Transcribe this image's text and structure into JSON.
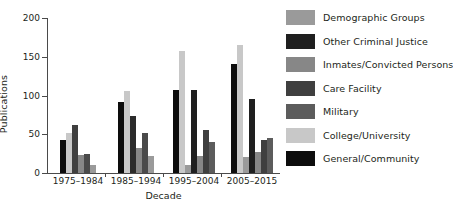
{
  "chart_data": {
    "type": "bar",
    "title": "",
    "xlabel": "Decade",
    "ylabel": "Publications",
    "categories": [
      "1975–1984",
      "1985–1994",
      "1995–2004",
      "2005–2015"
    ],
    "ylim": [
      0,
      200
    ],
    "yticks": [
      0,
      50,
      100,
      150,
      200
    ],
    "ytick_labels": [
      "0",
      "50",
      "100",
      "150",
      "200"
    ],
    "grid": false,
    "legend_position": "right",
    "bar_order_note": "Within each decade group bars are drawn left to right in the order listed in series[]",
    "series": [
      {
        "name": "General/Community",
        "color": "#0d0d0d",
        "values": [
          42,
          91,
          107,
          141
        ]
      },
      {
        "name": "College/University",
        "color": "#c8c8c8",
        "values": [
          51,
          106,
          157,
          165
        ]
      },
      {
        "name": "Military",
        "color": "#5c5c5c",
        "values": [
          0,
          0,
          0,
          0
        ]
      },
      {
        "name": "Care Facility",
        "color": "#3f3f3f",
        "values": [
          62,
          73,
          0,
          0
        ]
      },
      {
        "name": "Inmates/Convicted Persons",
        "color": "#878787",
        "values": [
          23,
          32,
          10,
          21
        ]
      },
      {
        "name": "Other Criminal Justice",
        "color": "#1f1f1f",
        "values": [
          25,
          52,
          107,
          95
        ]
      },
      {
        "name": "Demographic Groups",
        "color": "#9a9a9a",
        "values": [
          10,
          22,
          22,
          27
        ]
      },
      {
        "name": "Care Facility (late)",
        "color": "#3f3f3f",
        "values": [
          0,
          0,
          55,
          43
        ]
      },
      {
        "name": "Military (late)",
        "color": "#5c5c5c",
        "values": [
          0,
          0,
          40,
          45
        ]
      }
    ],
    "groups": [
      {
        "category": "1975–1984",
        "bars": [
          {
            "series": "General/Community",
            "value": 42,
            "color": "#0d0d0d"
          },
          {
            "series": "College/University",
            "value": 51,
            "color": "#c8c8c8"
          },
          {
            "series": "Care Facility",
            "value": 62,
            "color": "#3f3f3f"
          },
          {
            "series": "Inmates/Convicted Persons",
            "value": 23,
            "color": "#878787"
          },
          {
            "series": "Other Criminal Justice",
            "value": 25,
            "color": "#4a4a4a"
          },
          {
            "series": "Demographic Groups",
            "value": 10,
            "color": "#9a9a9a"
          }
        ]
      },
      {
        "category": "1985–1994",
        "bars": [
          {
            "series": "General/Community",
            "value": 91,
            "color": "#0d0d0d"
          },
          {
            "series": "College/University",
            "value": 106,
            "color": "#c8c8c8"
          },
          {
            "series": "Care Facility",
            "value": 73,
            "color": "#2b2b2b"
          },
          {
            "series": "Inmates/Convicted Persons",
            "value": 32,
            "color": "#878787"
          },
          {
            "series": "Other Criminal Justice",
            "value": 52,
            "color": "#4a4a4a"
          },
          {
            "series": "Demographic Groups",
            "value": 22,
            "color": "#9a9a9a"
          }
        ]
      },
      {
        "category": "1995–2004",
        "bars": [
          {
            "series": "General/Community",
            "value": 107,
            "color": "#0d0d0d"
          },
          {
            "series": "College/University",
            "value": 157,
            "color": "#c8c8c8"
          },
          {
            "series": "Demographic Groups",
            "value": 10,
            "color": "#9a9a9a"
          },
          {
            "series": "Other Criminal Justice",
            "value": 107,
            "color": "#1f1f1f"
          },
          {
            "series": "Inmates/Convicted Persons",
            "value": 22,
            "color": "#878787"
          },
          {
            "series": "Care Facility",
            "value": 55,
            "color": "#3f3f3f"
          },
          {
            "series": "Military",
            "value": 40,
            "color": "#5c5c5c"
          }
        ]
      },
      {
        "category": "2005–2015",
        "bars": [
          {
            "series": "General/Community",
            "value": 141,
            "color": "#0d0d0d"
          },
          {
            "series": "College/University",
            "value": 165,
            "color": "#c8c8c8"
          },
          {
            "series": "Demographic Groups",
            "value": 21,
            "color": "#9a9a9a"
          },
          {
            "series": "Other Criminal Justice",
            "value": 95,
            "color": "#1f1f1f"
          },
          {
            "series": "Inmates/Convicted Persons",
            "value": 27,
            "color": "#878787"
          },
          {
            "series": "Care Facility",
            "value": 43,
            "color": "#3f3f3f"
          },
          {
            "series": "Military",
            "value": 45,
            "color": "#5c5c5c"
          }
        ]
      }
    ],
    "legend": [
      {
        "label": "Demographic Groups",
        "color": "#9a9a9a"
      },
      {
        "label": "Other Criminal Justice",
        "color": "#1f1f1f"
      },
      {
        "label": "Inmates/Convicted Persons",
        "color": "#878787"
      },
      {
        "label": "Care Facility",
        "color": "#3f3f3f"
      },
      {
        "label": "Military",
        "color": "#5c5c5c"
      },
      {
        "label": "College/University",
        "color": "#c8c8c8"
      },
      {
        "label": "General/Community",
        "color": "#0d0d0d"
      }
    ]
  }
}
